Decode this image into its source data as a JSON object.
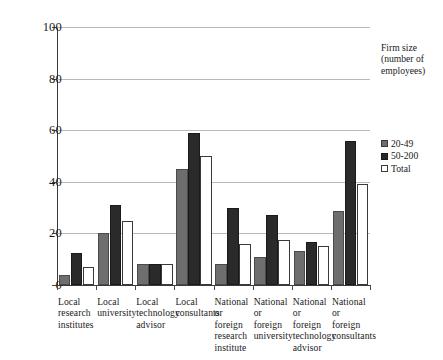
{
  "chart_data": {
    "type": "bar",
    "title": "",
    "xlabel": "",
    "ylabel": "",
    "ylim": [
      0,
      100
    ],
    "yticks": [
      0,
      20,
      40,
      60,
      80,
      100
    ],
    "grid": true,
    "legend_position": "right",
    "legend_title": "Firm size (number of employees)",
    "categories": [
      "Local research institutes",
      "Local university",
      "Local technology advisor",
      "Local consultants",
      "National or foreign research institute",
      "National or foreign university",
      "National or foreign technology advisor",
      "National or foreign consultants"
    ],
    "series": [
      {
        "name": "20-49",
        "color": "#6e6e6e",
        "values": [
          4,
          20,
          8,
          45,
          8,
          11,
          13,
          28.5
        ]
      },
      {
        "name": "50-200",
        "color": "#2a2a2a",
        "values": [
          12.5,
          31,
          8,
          59,
          30,
          27,
          16.5,
          56
        ]
      },
      {
        "name": "Total",
        "color": "#ffffff",
        "values": [
          7,
          25,
          8,
          50,
          16,
          17.5,
          15,
          39
        ]
      }
    ]
  },
  "legend": {
    "title_lines": [
      "Firm size",
      "(number of",
      "employees)"
    ],
    "items": [
      {
        "label": "20-49"
      },
      {
        "label": "50-200"
      },
      {
        "label": "Total"
      }
    ]
  },
  "yaxis": {
    "ticks": [
      "0",
      "20",
      "40",
      "60",
      "80",
      "100"
    ]
  },
  "xaxis": {
    "label_lines": [
      [
        "Local",
        "research",
        "institutes"
      ],
      [
        "Local",
        "university"
      ],
      [
        "Local",
        "technology",
        "advisor"
      ],
      [
        "Local",
        "consultants"
      ],
      [
        "National",
        "or foreign",
        "research",
        "institute"
      ],
      [
        "National",
        "or foreign",
        "university"
      ],
      [
        "National",
        "or foreign",
        "technology",
        "advisor"
      ],
      [
        "National",
        "or foreign",
        "consultants"
      ]
    ]
  }
}
